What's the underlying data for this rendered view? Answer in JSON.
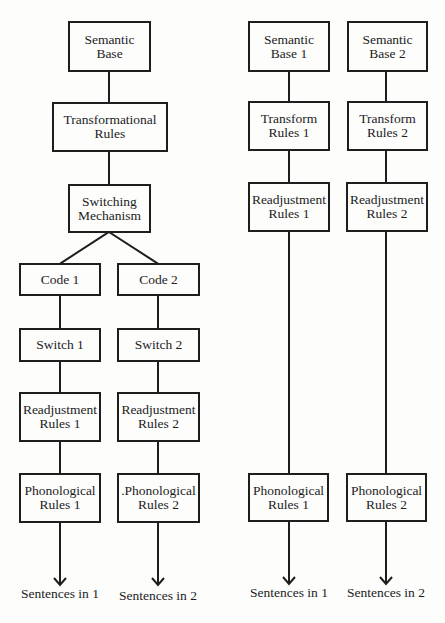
{
  "diagram": {
    "left_model": {
      "semantic_base": {
        "line1": "Semantic",
        "line2": "Base"
      },
      "transformational_rules": {
        "line1": "Transformational",
        "line2": "Rules"
      },
      "switching_mechanism": {
        "line1": "Switching",
        "line2": "Mechanism"
      },
      "branch1": {
        "code": "Code 1",
        "switch": "Switch 1",
        "readjustment": {
          "line1": "Readjustment",
          "line2": "Rules  1"
        },
        "phonological": {
          "line1": "Phonological",
          "line2": "Rules 1"
        },
        "output": "Sentences in 1"
      },
      "branch2": {
        "code": "Code 2",
        "switch": "Switch 2",
        "readjustment": {
          "line1": "Readjustment",
          "line2": "Rules 2"
        },
        "phonological": {
          "line1": ".Phonological",
          "line2": "Rules 2"
        },
        "output": "Sentences in 2"
      }
    },
    "right_model": {
      "branch1": {
        "semantic_base": {
          "line1": "Semantic",
          "line2": "Base 1"
        },
        "transform_rules": {
          "line1": "Transform",
          "line2": "Rules 1"
        },
        "readjustment": {
          "line1": "Readjustment",
          "line2": "Rules 1"
        },
        "phonological": {
          "line1": "Phonological",
          "line2": "Rules 1"
        },
        "output": "Sentences in 1"
      },
      "branch2": {
        "semantic_base": {
          "line1": "Semantic",
          "line2": "Base 2"
        },
        "transform_rules": {
          "line1": "Transform",
          "line2": "Rules 2"
        },
        "readjustment": {
          "line1": "Readjustment",
          "line2": "Rules 2"
        },
        "phonological": {
          "line1": "Phonological",
          "line2": "Rules 2"
        },
        "output": "Sentences in 2"
      }
    },
    "colors": {
      "stroke": "#1e1e1e",
      "background": "#fdfdfc",
      "text": "#1c1c1c"
    }
  }
}
